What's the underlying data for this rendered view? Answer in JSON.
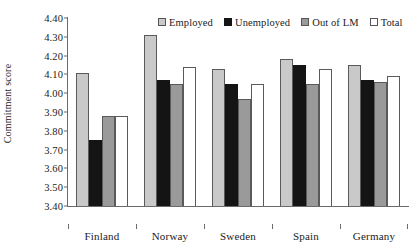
{
  "chart_data": {
    "type": "bar",
    "title": "",
    "subtitle": "",
    "xlabel": "",
    "ylabel": "Commitment score",
    "ylim": [
      3.4,
      4.4
    ],
    "ytick_labels": [
      "4.40",
      "4.30",
      "4.20",
      "4.10",
      "4.00",
      "3.90",
      "3.80",
      "3.70",
      "3.60",
      "3.50",
      "3.40"
    ],
    "ytick_values": [
      4.4,
      4.3,
      4.2,
      4.1,
      4.0,
      3.9,
      3.8,
      3.7,
      3.6,
      3.5,
      3.4
    ],
    "grid": false,
    "legend_position": "top-right",
    "categories": [
      "Finland",
      "Norway",
      "Sweden",
      "Spain",
      "Germany"
    ],
    "series": [
      {
        "name": "Employed",
        "color": "#c9c9c9",
        "values": [
          4.11,
          4.31,
          4.13,
          4.18,
          4.15
        ]
      },
      {
        "name": "Unemployed",
        "color": "#141414",
        "values": [
          3.75,
          4.07,
          4.05,
          4.15,
          4.07
        ]
      },
      {
        "name": "Out of LM",
        "color": "#9a9a9a",
        "values": [
          3.88,
          4.05,
          3.97,
          4.05,
          4.06
        ]
      },
      {
        "name": "Total",
        "color": "#ffffff",
        "values": [
          3.88,
          4.14,
          4.05,
          4.13,
          4.09
        ]
      }
    ]
  }
}
